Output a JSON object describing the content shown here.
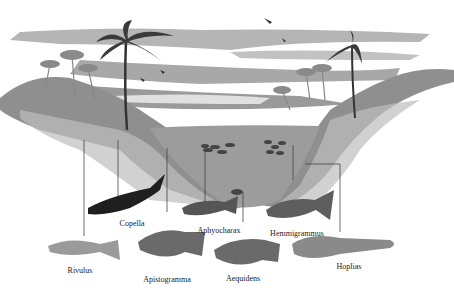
{
  "figure": {
    "colors": {
      "sky": "#ffffff",
      "cloud": "#a9a9a9",
      "water": "#9c9c9c",
      "bank": "#8a8a8a",
      "fish_dark": "#1c1c1c",
      "fish_mid": "#6e6e6e",
      "line": "#444444"
    },
    "labels": [
      {
        "name": "Copella",
        "x": 132,
        "y": 219
      },
      {
        "name": "Aphyocharax",
        "x": 219,
        "y": 226
      },
      {
        "name": "Hemmigrammus",
        "x": 297,
        "y": 229
      },
      {
        "name": "Rivulus",
        "x": 80,
        "y": 266
      },
      {
        "name": "Apistogramma",
        "x": 167,
        "y": 275
      },
      {
        "name": "Aequidens",
        "x": 243,
        "y": 274
      },
      {
        "name": "Hoplias",
        "x": 349,
        "y": 262
      }
    ]
  }
}
